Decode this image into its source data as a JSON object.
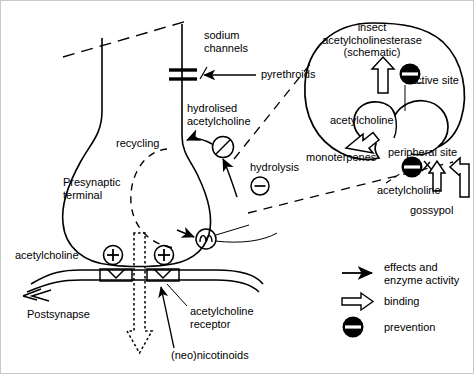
{
  "diagram": {
    "title_alt": "Synaptic transmission and insecticide targets (schematic)",
    "labels": {
      "sodium_channels": "sodium\nchannels",
      "pyrethroids": "pyrethroids",
      "hydrolised_acetylcholine": "hydrolised\nacetylcholine",
      "recycling": "recycling",
      "presynaptic_terminal": "Presynaptic\nterminal",
      "hydrolysis": "hydrolysis",
      "acetylcholine_presyn": "acetylcholine",
      "postsynapse": "Postsynapse",
      "acetylcholine_receptor": "acetylcholine\nreceptor",
      "neonicotinoids": "(neo)nicotinoids",
      "insect_ache": "insect\nacetylcholinesterase\n(schematic)",
      "active_site": "active site",
      "acetylcholine_enzyme": "acetylcholine",
      "monoterpenes": "monoterpenes",
      "peripheral_site": "peripheral site",
      "acetylcholine_peripheral": "acetylcholine",
      "gossypol": "gossypol"
    },
    "legend": {
      "items": [
        {
          "symbol": "solid-arrow-icon",
          "label": "effects and\nenzyme activity"
        },
        {
          "symbol": "hollow-arrow-icon",
          "label": "binding"
        },
        {
          "symbol": "prevention-icon",
          "label": "prevention"
        }
      ]
    },
    "symbols": {
      "plus_sign": "+",
      "minus_sign": "−"
    },
    "colors": {
      "stroke": "#000000",
      "background": "#ffffff",
      "frame": "#c9c9c9"
    }
  }
}
